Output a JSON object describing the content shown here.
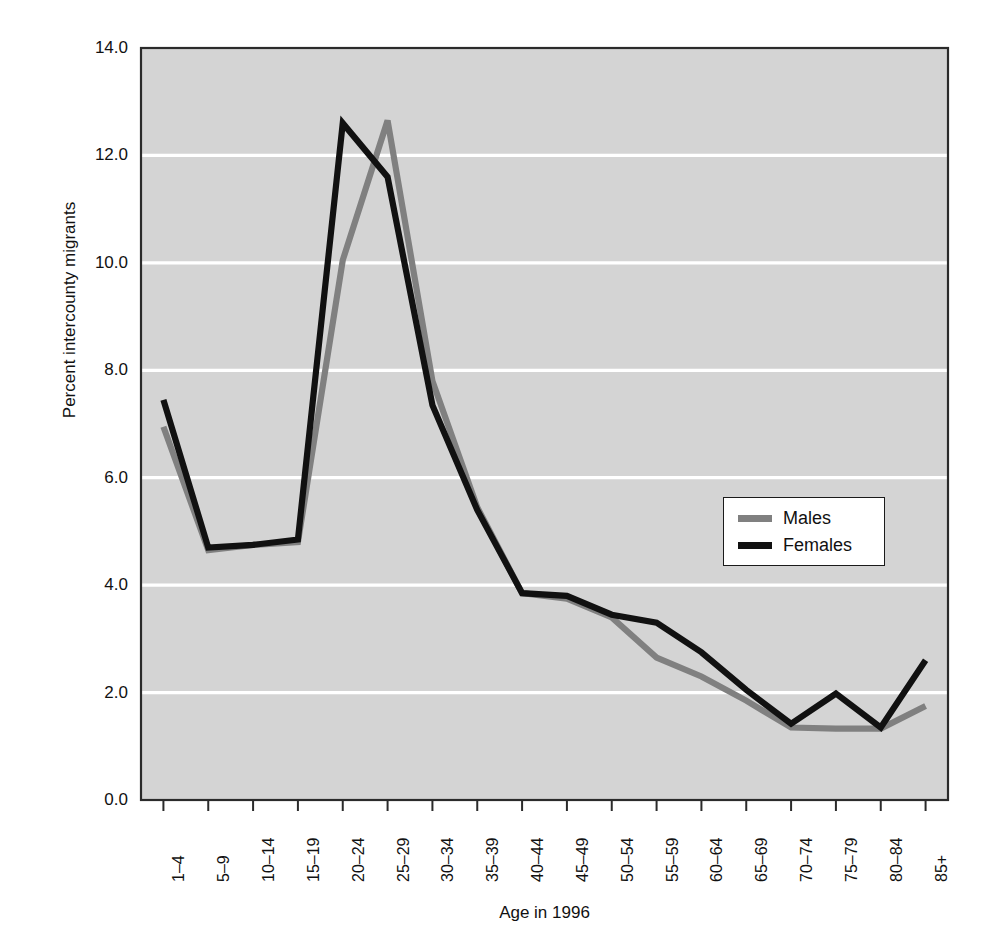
{
  "figure": {
    "partial_top_text": "",
    "plot": {
      "background_color": "#d4d4d4",
      "gridline_color": "#ffffff",
      "border_color": "#2b2b2b"
    }
  },
  "chart_data": {
    "type": "line",
    "title": "",
    "xlabel": "Age in 1996",
    "ylabel": "Percent intercounty migrants",
    "ylim": [
      0.0,
      14.0
    ],
    "ytick_step": 2.0,
    "ytick_labels": [
      "14.0",
      "12.0",
      "10.0",
      "8.0",
      "6.0",
      "4.0",
      "2.0",
      "0.0"
    ],
    "ytick_values": [
      14.0,
      12.0,
      10.0,
      8.0,
      6.0,
      4.0,
      2.0,
      0.0
    ],
    "grid": true,
    "grid_axis": "y",
    "legend_position": "center-right",
    "categories": [
      "1–4",
      "5–9",
      "10–14",
      "15–19",
      "20–24",
      "25–29",
      "30–34",
      "35–39",
      "40–44",
      "45–49",
      "50–54",
      "55–59",
      "60–64",
      "65–69",
      "70–74",
      "75–79",
      "80–84",
      "85+"
    ],
    "series": [
      {
        "name": "Males",
        "color": "#808080",
        "values": [
          6.95,
          4.65,
          4.75,
          4.8,
          10.05,
          12.65,
          7.8,
          5.45,
          3.85,
          3.75,
          3.4,
          2.65,
          2.3,
          1.85,
          1.35,
          1.33,
          1.33,
          1.75
        ]
      },
      {
        "name": "Females",
        "color": "#111111",
        "values": [
          7.45,
          4.7,
          4.75,
          4.85,
          12.6,
          11.6,
          7.35,
          5.4,
          3.85,
          3.8,
          3.45,
          3.3,
          2.75,
          2.05,
          1.42,
          1.98,
          1.35,
          2.6
        ]
      }
    ]
  },
  "legend": {
    "entries": [
      {
        "label": "Males",
        "color": "#808080"
      },
      {
        "label": "Females",
        "color": "#111111"
      }
    ]
  }
}
